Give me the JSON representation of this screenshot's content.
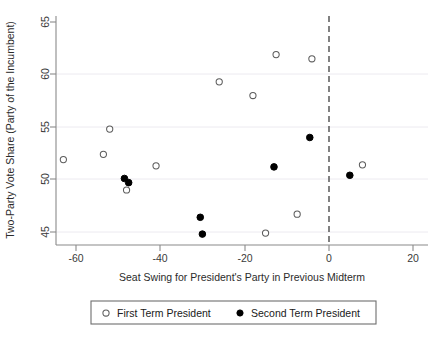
{
  "chart_data": {
    "type": "scatter",
    "title": "",
    "xlabel": "Seat Swing for President's Party in Previous Midterm",
    "ylabel": "Two-Party Vote Share (Party of the Incumbent)",
    "xlim": [
      -65,
      21
    ],
    "ylim": [
      43.8,
      66
    ],
    "xticks": [
      -60,
      -40,
      -20,
      0,
      20
    ],
    "xticklabels": [
      "-60",
      "-40",
      "-20",
      "0",
      "20"
    ],
    "yticks": [
      45,
      50,
      55,
      60,
      65
    ],
    "yticklabels": [
      "45",
      "50",
      "55",
      "60",
      "65"
    ],
    "grid": "horizontal-faint",
    "legend_position": "below-plot",
    "annotations": [
      {
        "name": "zero-reference-line",
        "type": "vline",
        "x": 0,
        "style": "dashed"
      }
    ],
    "series": [
      {
        "name": "First Term President",
        "marker": "open-circle",
        "color": "#ffffff",
        "edge_color": "#5c5c5c",
        "points": [
          {
            "x": -63.0,
            "y": 51.9
          },
          {
            "x": -53.5,
            "y": 52.4
          },
          {
            "x": -52.0,
            "y": 54.8
          },
          {
            "x": -48.0,
            "y": 49.0
          },
          {
            "x": -41.0,
            "y": 51.3
          },
          {
            "x": -26.0,
            "y": 59.3
          },
          {
            "x": -18.0,
            "y": 58.0
          },
          {
            "x": -15.0,
            "y": 44.9
          },
          {
            "x": -12.5,
            "y": 61.9
          },
          {
            "x": -7.5,
            "y": 46.7
          },
          {
            "x": -4.0,
            "y": 61.5
          },
          {
            "x": 8.0,
            "y": 51.4
          }
        ]
      },
      {
        "name": "Second Term President",
        "marker": "filled-circle",
        "color": "#000000",
        "edge_color": "#000000",
        "points": [
          {
            "x": -48.5,
            "y": 50.1
          },
          {
            "x": -47.5,
            "y": 49.7
          },
          {
            "x": -30.5,
            "y": 46.4
          },
          {
            "x": -30.0,
            "y": 44.8
          },
          {
            "x": -13.0,
            "y": 51.2
          },
          {
            "x": -4.5,
            "y": 54.0
          },
          {
            "x": 5.0,
            "y": 50.4
          }
        ]
      }
    ]
  },
  "legend": {
    "entries": [
      {
        "label": "First Term President",
        "marker": "open-circle"
      },
      {
        "label": "Second Term President",
        "marker": "filled-circle"
      }
    ]
  }
}
